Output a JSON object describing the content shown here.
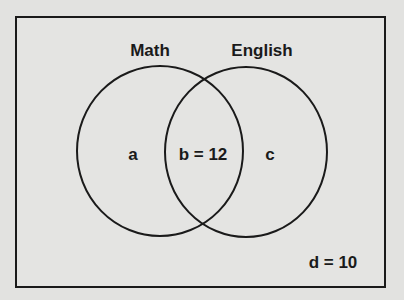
{
  "diagram": {
    "type": "venn",
    "sets": [
      {
        "name": "Math",
        "region_label": "a"
      },
      {
        "name": "English",
        "region_label": "c"
      }
    ],
    "intersection_label": "b = 12",
    "outside_label": "d = 10",
    "colors": {
      "background": "#e2e2e0",
      "stroke": "#1a1a1a"
    }
  }
}
